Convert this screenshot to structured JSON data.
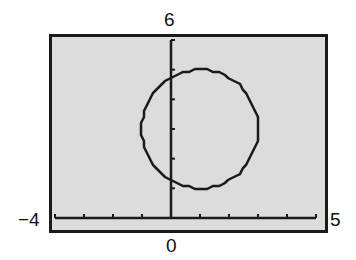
{
  "chart_data": {
    "type": "line",
    "title": "",
    "equation": "(x-1)^2 + (y-3)^2 = 4",
    "center": [
      1,
      3
    ],
    "radius": 2,
    "xlim": [
      -4,
      5
    ],
    "ylim": [
      0,
      6
    ],
    "xscale": 1,
    "yscale": 1,
    "labels": {
      "xmin": "−4",
      "xmax": "5",
      "ymax": "6",
      "origin": "0"
    },
    "grid": false,
    "colors": {
      "screen": "#dcdcdc",
      "ink": "#1a1a1a"
    }
  }
}
